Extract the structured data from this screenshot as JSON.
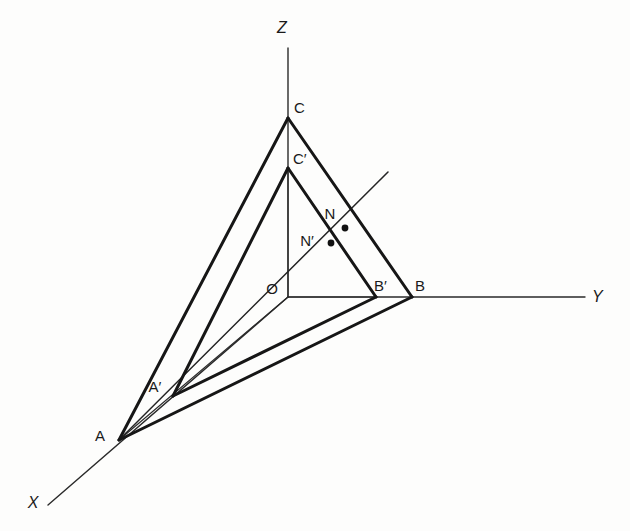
{
  "figure": {
    "background_color": "#fdfdfc",
    "stroke_color": "#1a1a1a",
    "width": 630,
    "height": 531
  },
  "axes": [
    {
      "name": "x-axis",
      "label": "X",
      "label_x": 33,
      "label_y": 508,
      "style": "italic",
      "x1": 48,
      "y1": 505,
      "x2": 288,
      "y2": 297
    },
    {
      "name": "y-axis",
      "label": "Y",
      "label_x": 592,
      "label_y": 302,
      "style": "italic",
      "x1": 288,
      "y1": 297,
      "x2": 585,
      "y2": 297
    },
    {
      "name": "z-axis",
      "label": "Z",
      "label_x": 282,
      "label_y": 33,
      "style": "italic",
      "x1": 288,
      "y1": 48,
      "x2": 288,
      "y2": 297
    }
  ],
  "points": [
    {
      "name": "O",
      "label": "O",
      "x": 288,
      "y": 297,
      "label_x": 272,
      "label_y": 294,
      "dot": false
    },
    {
      "name": "A",
      "label": "A",
      "x": 119,
      "y": 440,
      "label_x": 100,
      "label_y": 441,
      "dot": false
    },
    {
      "name": "B",
      "label": "B",
      "x": 412,
      "y": 297,
      "label_x": 415,
      "label_y": 291,
      "dot": false
    },
    {
      "name": "C",
      "label": "C",
      "x": 288,
      "y": 118,
      "label_x": 294,
      "label_y": 113,
      "dot": false
    },
    {
      "name": "A-prime",
      "label": "A′",
      "x": 173,
      "y": 396,
      "label_x": 155,
      "label_y": 392,
      "dot": false
    },
    {
      "name": "B-prime",
      "label": "B′",
      "x": 376,
      "y": 297,
      "label_x": 374,
      "label_y": 291,
      "dot": false
    },
    {
      "name": "C-prime",
      "label": "C′",
      "x": 288,
      "y": 168,
      "label_x": 293,
      "label_y": 164,
      "dot": false
    },
    {
      "name": "N",
      "label": "N",
      "x": 345,
      "y": 228,
      "label_x": 330,
      "label_y": 219,
      "dot": true
    },
    {
      "name": "N-prime",
      "label": "N′",
      "x": 331,
      "y": 243,
      "label_x": 307,
      "label_y": 246,
      "dot": true
    }
  ],
  "edges": {
    "outer_triangle": [
      {
        "name": "edge-A-C",
        "from": "A",
        "to": "C",
        "weight": "thick"
      },
      {
        "name": "edge-C-B",
        "from": "C",
        "to": "B",
        "weight": "thick"
      },
      {
        "name": "edge-A-B",
        "from": "A",
        "to": "B",
        "weight": "thick"
      }
    ],
    "inner_triangle": [
      {
        "name": "edge-Ap-Cp",
        "from": "A-prime",
        "to": "C-prime",
        "weight": "thick"
      },
      {
        "name": "edge-Cp-Bp",
        "from": "C-prime",
        "to": "B-prime",
        "weight": "thick"
      },
      {
        "name": "edge-Ap-Bp",
        "from": "A-prime",
        "to": "B-prime",
        "weight": "thick"
      }
    ],
    "construction": [
      {
        "name": "line-O-C-prime",
        "from": "O",
        "to": "C-prime",
        "weight": "thin"
      },
      {
        "name": "line-O-B-prime",
        "from": "O",
        "to": "B-prime",
        "weight": "thin"
      },
      {
        "name": "line-O-A",
        "from": "O",
        "to": "A",
        "weight": "thin"
      }
    ],
    "ray": {
      "name": "ray-A-through-N",
      "from": "A",
      "through": [
        "N-prime",
        "N"
      ],
      "end_x": 388,
      "end_y": 172,
      "weight": "thin"
    }
  },
  "legend_note": {
    "vertex_labels": [
      "O",
      "A",
      "B",
      "C",
      "A′",
      "B′",
      "C′",
      "N",
      "N′"
    ],
    "axis_labels": [
      "X",
      "Y",
      "Z"
    ]
  }
}
